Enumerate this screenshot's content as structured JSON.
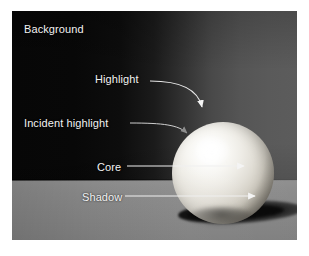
{
  "figure": {
    "kind": "annotated-photograph",
    "frame": {
      "left": 12,
      "top": 11,
      "width": 285,
      "height": 229
    }
  },
  "colors": {
    "page_background": "#ffffff",
    "backdrop_dark": "#070707",
    "backdrop_light": "#5c5c5c",
    "floor": "#888888",
    "sphere_lit": "#ffffff",
    "sphere_terminator": "#3a3834",
    "cast_shadow": "#0a0a0a",
    "label_text": "#f2f2f2",
    "leader_line": "#e8e8e8",
    "incident_arrow": "#8d8d8d"
  },
  "labels": [
    {
      "id": "background",
      "text": "Background"
    },
    {
      "id": "highlight",
      "text": "Highlight"
    },
    {
      "id": "incident-highlight",
      "text": "Incident highlight"
    },
    {
      "id": "core",
      "text": "Core"
    },
    {
      "id": "shadow",
      "text": "Shadow"
    }
  ],
  "callouts": {
    "background": {
      "label": "Background",
      "style": "no-leader",
      "target": "dark backdrop wall, upper-left"
    },
    "highlight": {
      "label": "Highlight",
      "style": "curved-leader-with-arrowhead",
      "arrow_direction": "down",
      "target": "brightest specular spot at the top of the sphere"
    },
    "incident_highlight": {
      "label": "Incident highlight",
      "style": "curved-leader-with-arrowhead",
      "arrow_direction": "down-right",
      "arrow_tone": "grey",
      "target": "upper-left diffuse lit area of the sphere"
    },
    "core": {
      "label": "Core",
      "style": "straight-horizontal-leader-with-arrowhead",
      "arrow_direction": "right",
      "target": "core shadow band on the right side of the sphere"
    },
    "shadow": {
      "label": "Shadow",
      "style": "straight-horizontal-leader-with-arrowhead",
      "arrow_direction": "right",
      "target": "shadow side / cast shadow of the sphere"
    }
  }
}
